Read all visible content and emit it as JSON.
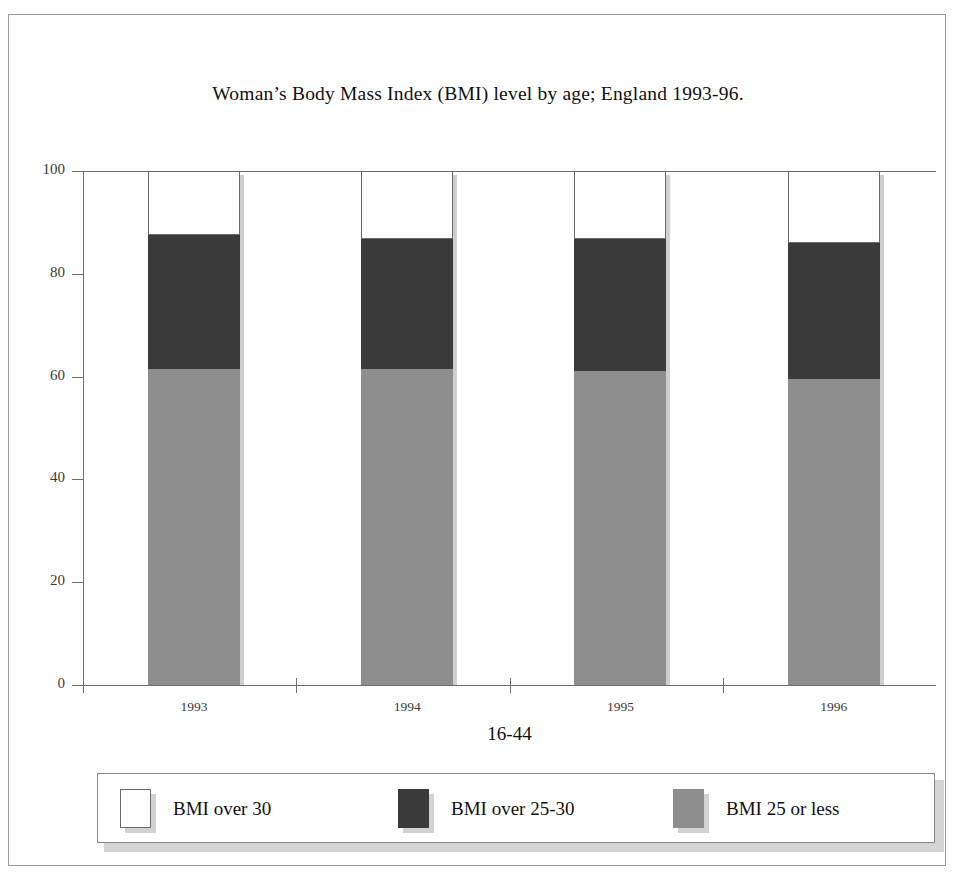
{
  "figure": {
    "title": "Woman’s Body Mass Index (BMI) level by age; England 1993-96."
  },
  "axes": {
    "y_title": "Percentage",
    "x_title": "16-44",
    "y_ticks": [
      "0",
      "20",
      "40",
      "60",
      "80",
      "100"
    ],
    "x_ticks": [
      "1993",
      "1994",
      "1995",
      "1996"
    ]
  },
  "legend": {
    "items": [
      {
        "label": "BMI over 30",
        "swatch": "white",
        "color": "#ffffff"
      },
      {
        "label": "BMI over 25-30",
        "swatch": "dark",
        "color": "#3a3a3a"
      },
      {
        "label": "BMI 25 or less",
        "swatch": "gray",
        "color": "#8e8e8e"
      }
    ]
  },
  "chart_data": {
    "type": "bar",
    "subtype": "stacked-percentage",
    "title": "Woman’s Body Mass Index (BMI) level by age; England 1993-96.",
    "xlabel": "16-44",
    "ylabel": "Percentage",
    "ylim": [
      0,
      100
    ],
    "ytick_step": 20,
    "grid": false,
    "legend_position": "bottom",
    "categories": [
      "1993",
      "1994",
      "1995",
      "1996"
    ],
    "series": [
      {
        "name": "BMI 25 or less",
        "color": "#8e8e8e",
        "values": [
          61.5,
          61.5,
          61.0,
          59.5
        ]
      },
      {
        "name": "BMI over 25-30",
        "color": "#3a3a3a",
        "values": [
          26.0,
          25.3,
          25.8,
          26.5
        ]
      },
      {
        "name": "BMI over 30",
        "color": "#ffffff",
        "values": [
          12.5,
          13.2,
          13.2,
          14.0
        ]
      }
    ],
    "cumulative_tops": {
      "BMI 25 or less": [
        61.5,
        61.5,
        61.0,
        59.5
      ],
      "BMI over 25-30": [
        87.5,
        86.8,
        86.8,
        86.0
      ],
      "BMI over 30": [
        100,
        100,
        100,
        100
      ]
    }
  }
}
